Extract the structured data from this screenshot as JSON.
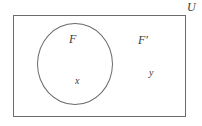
{
  "diagram": {
    "type": "venn-set-diagram",
    "universal_set_label": "U",
    "set_label": "F",
    "complement_label": "F′",
    "element_in_set": "x",
    "element_in_complement": "y"
  },
  "colors": {
    "line": "#6b6b6b",
    "text": "#3a3a3a",
    "background": "#ffffff"
  }
}
